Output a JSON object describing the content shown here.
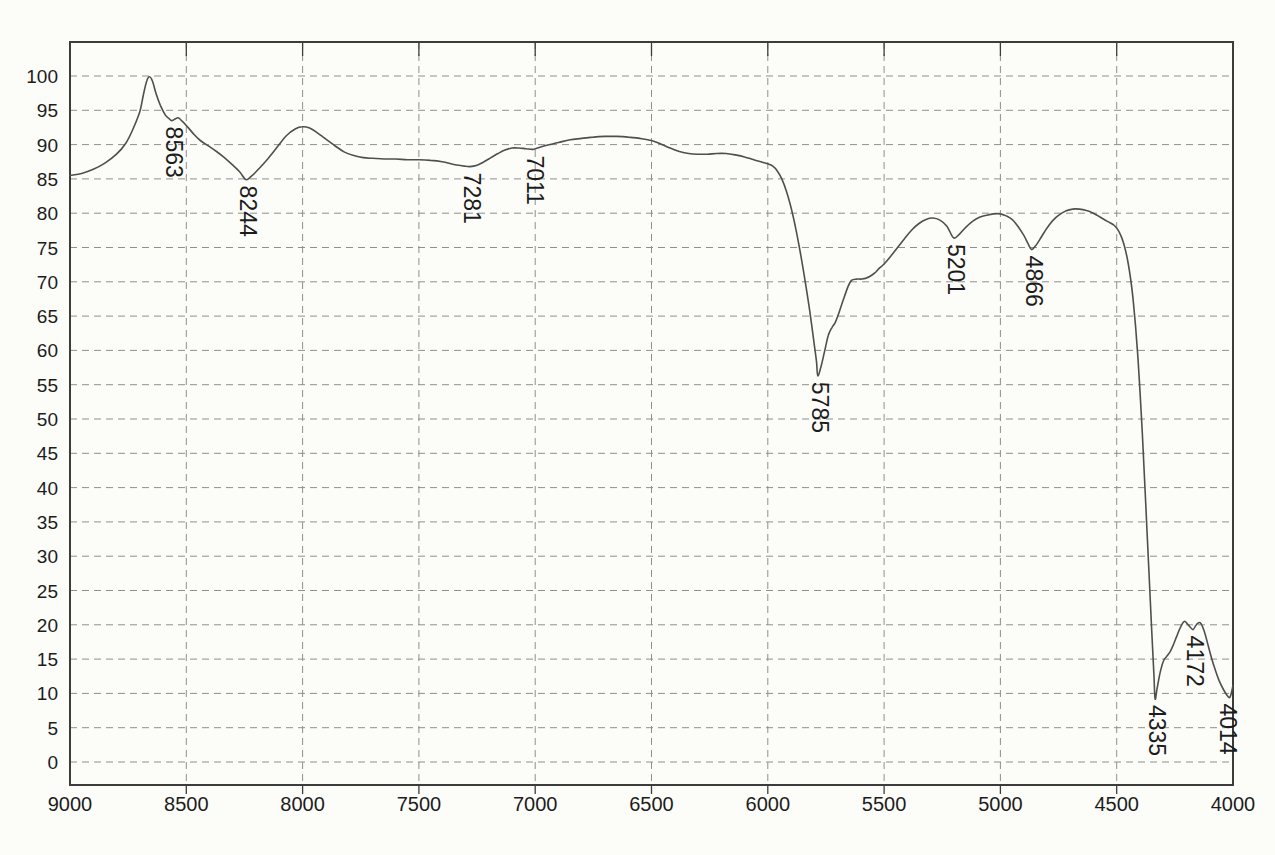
{
  "page": {
    "background": "#fcfcf9"
  },
  "chart_data": {
    "type": "line",
    "title": "",
    "subtitle": "",
    "xlabel": "",
    "ylabel": "",
    "legend": "none",
    "grid": "dashed",
    "xlim": [
      9000,
      4000
    ],
    "ylim": [
      0,
      100
    ],
    "x_ticks": [
      9000,
      8500,
      8000,
      7500,
      7000,
      6500,
      6000,
      5500,
      5000,
      4500,
      4000
    ],
    "y_ticks": [
      0,
      5,
      10,
      15,
      20,
      25,
      30,
      35,
      40,
      45,
      50,
      55,
      60,
      65,
      70,
      75,
      80,
      85,
      90,
      95,
      100
    ],
    "colors": {
      "line": "#4f4f4f",
      "grid": "#8f8f8f",
      "frame": "#3c3c3c",
      "text": "#1c1c1c"
    },
    "peak_labels": [
      {
        "label": "8563",
        "wavenumber": 8563,
        "value": 93.5
      },
      {
        "label": "8244",
        "wavenumber": 8244,
        "value": 84.9
      },
      {
        "label": "7281",
        "wavenumber": 7281,
        "value": 86.8
      },
      {
        "label": "7011",
        "wavenumber": 7011,
        "value": 89.3
      },
      {
        "label": "5785",
        "wavenumber": 5785,
        "value": 56.3
      },
      {
        "label": "5201",
        "wavenumber": 5201,
        "value": 76.4
      },
      {
        "label": "4866",
        "wavenumber": 4866,
        "value": 74.7
      },
      {
        "label": "4335",
        "wavenumber": 4335,
        "value": 9.2
      },
      {
        "label": "4172",
        "wavenumber": 4172,
        "value": 19.3
      },
      {
        "label": "4014",
        "wavenumber": 4014,
        "value": 9.4
      }
    ],
    "series": [
      {
        "name": "transmittance-spectrum",
        "points": [
          [
            9000,
            85.5
          ],
          [
            8950,
            85.8
          ],
          [
            8900,
            86.4
          ],
          [
            8850,
            87.3
          ],
          [
            8800,
            88.6
          ],
          [
            8760,
            90.2
          ],
          [
            8730,
            92.2
          ],
          [
            8700,
            94.8
          ],
          [
            8685,
            97.2
          ],
          [
            8670,
            99.3
          ],
          [
            8658,
            99.9
          ],
          [
            8645,
            99.2
          ],
          [
            8630,
            97.4
          ],
          [
            8610,
            95.6
          ],
          [
            8590,
            94.3
          ],
          [
            8575,
            93.8
          ],
          [
            8563,
            93.5
          ],
          [
            8550,
            93.7
          ],
          [
            8535,
            93.9
          ],
          [
            8520,
            93.5
          ],
          [
            8500,
            92.8
          ],
          [
            8470,
            91.6
          ],
          [
            8440,
            90.6
          ],
          [
            8400,
            89.7
          ],
          [
            8370,
            89.0
          ],
          [
            8340,
            88.2
          ],
          [
            8300,
            87.0
          ],
          [
            8270,
            86.0
          ],
          [
            8244,
            84.9
          ],
          [
            8220,
            85.4
          ],
          [
            8190,
            86.4
          ],
          [
            8150,
            87.9
          ],
          [
            8110,
            89.6
          ],
          [
            8070,
            91.3
          ],
          [
            8030,
            92.3
          ],
          [
            8000,
            92.6
          ],
          [
            7970,
            92.4
          ],
          [
            7940,
            91.8
          ],
          [
            7900,
            90.8
          ],
          [
            7860,
            89.8
          ],
          [
            7820,
            88.9
          ],
          [
            7780,
            88.4
          ],
          [
            7740,
            88.1
          ],
          [
            7700,
            88.0
          ],
          [
            7650,
            87.9
          ],
          [
            7600,
            87.9
          ],
          [
            7550,
            87.8
          ],
          [
            7500,
            87.8
          ],
          [
            7450,
            87.7
          ],
          [
            7400,
            87.5
          ],
          [
            7350,
            87.1
          ],
          [
            7310,
            86.9
          ],
          [
            7281,
            86.8
          ],
          [
            7250,
            87.0
          ],
          [
            7220,
            87.5
          ],
          [
            7190,
            88.1
          ],
          [
            7160,
            88.7
          ],
          [
            7130,
            89.2
          ],
          [
            7100,
            89.5
          ],
          [
            7070,
            89.5
          ],
          [
            7040,
            89.4
          ],
          [
            7011,
            89.3
          ],
          [
            6990,
            89.5
          ],
          [
            6950,
            89.9
          ],
          [
            6900,
            90.3
          ],
          [
            6850,
            90.7
          ],
          [
            6800,
            90.9
          ],
          [
            6750,
            91.1
          ],
          [
            6700,
            91.2
          ],
          [
            6650,
            91.2
          ],
          [
            6600,
            91.1
          ],
          [
            6550,
            90.9
          ],
          [
            6500,
            90.6
          ],
          [
            6460,
            90.1
          ],
          [
            6420,
            89.5
          ],
          [
            6380,
            89.0
          ],
          [
            6340,
            88.7
          ],
          [
            6300,
            88.6
          ],
          [
            6260,
            88.6
          ],
          [
            6220,
            88.7
          ],
          [
            6180,
            88.7
          ],
          [
            6140,
            88.5
          ],
          [
            6100,
            88.2
          ],
          [
            6060,
            87.8
          ],
          [
            6020,
            87.4
          ],
          [
            6000,
            87.2
          ],
          [
            5980,
            86.9
          ],
          [
            5960,
            86.2
          ],
          [
            5940,
            85.0
          ],
          [
            5920,
            83.2
          ],
          [
            5900,
            80.8
          ],
          [
            5880,
            77.8
          ],
          [
            5860,
            74.2
          ],
          [
            5840,
            70.2
          ],
          [
            5820,
            65.8
          ],
          [
            5800,
            60.8
          ],
          [
            5790,
            58.2
          ],
          [
            5785,
            56.3
          ],
          [
            5770,
            57.8
          ],
          [
            5755,
            60.0
          ],
          [
            5740,
            62.2
          ],
          [
            5725,
            63.3
          ],
          [
            5710,
            64.1
          ],
          [
            5695,
            65.4
          ],
          [
            5675,
            67.4
          ],
          [
            5655,
            69.3
          ],
          [
            5640,
            70.2
          ],
          [
            5620,
            70.4
          ],
          [
            5600,
            70.4
          ],
          [
            5580,
            70.5
          ],
          [
            5560,
            70.8
          ],
          [
            5540,
            71.3
          ],
          [
            5520,
            72.0
          ],
          [
            5500,
            72.6
          ],
          [
            5470,
            73.8
          ],
          [
            5440,
            75.1
          ],
          [
            5410,
            76.4
          ],
          [
            5380,
            77.6
          ],
          [
            5350,
            78.5
          ],
          [
            5320,
            79.1
          ],
          [
            5290,
            79.3
          ],
          [
            5260,
            79.0
          ],
          [
            5230,
            78.1
          ],
          [
            5201,
            76.4
          ],
          [
            5175,
            77.0
          ],
          [
            5150,
            77.9
          ],
          [
            5120,
            78.8
          ],
          [
            5090,
            79.4
          ],
          [
            5060,
            79.7
          ],
          [
            5030,
            79.9
          ],
          [
            5000,
            79.9
          ],
          [
            4975,
            79.6
          ],
          [
            4950,
            79.1
          ],
          [
            4925,
            78.1
          ],
          [
            4900,
            76.8
          ],
          [
            4880,
            75.5
          ],
          [
            4866,
            74.7
          ],
          [
            4850,
            75.2
          ],
          [
            4830,
            76.2
          ],
          [
            4810,
            77.3
          ],
          [
            4790,
            78.3
          ],
          [
            4770,
            79.1
          ],
          [
            4750,
            79.7
          ],
          [
            4720,
            80.3
          ],
          [
            4690,
            80.6
          ],
          [
            4660,
            80.6
          ],
          [
            4630,
            80.4
          ],
          [
            4600,
            80.0
          ],
          [
            4570,
            79.4
          ],
          [
            4540,
            78.8
          ],
          [
            4510,
            78.2
          ],
          [
            4490,
            77.3
          ],
          [
            4470,
            75.6
          ],
          [
            4450,
            72.6
          ],
          [
            4430,
            67.6
          ],
          [
            4410,
            59.6
          ],
          [
            4390,
            48.0
          ],
          [
            4370,
            34.0
          ],
          [
            4350,
            19.5
          ],
          [
            4340,
            12.8
          ],
          [
            4335,
            9.2
          ],
          [
            4326,
            10.8
          ],
          [
            4312,
            13.2
          ],
          [
            4298,
            14.8
          ],
          [
            4285,
            15.4
          ],
          [
            4270,
            16.1
          ],
          [
            4255,
            17.2
          ],
          [
            4240,
            18.5
          ],
          [
            4225,
            19.7
          ],
          [
            4210,
            20.5
          ],
          [
            4195,
            20.1
          ],
          [
            4185,
            19.7
          ],
          [
            4172,
            19.3
          ],
          [
            4160,
            19.9
          ],
          [
            4148,
            20.3
          ],
          [
            4138,
            20.2
          ],
          [
            4125,
            19.2
          ],
          [
            4110,
            17.4
          ],
          [
            4095,
            15.5
          ],
          [
            4080,
            13.8
          ],
          [
            4060,
            11.9
          ],
          [
            4040,
            10.5
          ],
          [
            4025,
            9.7
          ],
          [
            4014,
            9.4
          ],
          [
            4006,
            10.2
          ],
          [
            4000,
            11.2
          ]
        ]
      }
    ]
  }
}
